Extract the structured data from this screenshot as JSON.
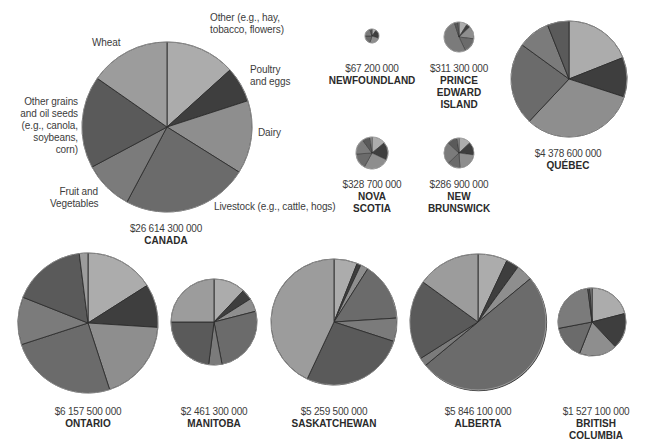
{
  "chart_data": [
    {
      "type": "pie",
      "title": "CANADA",
      "total_label": "$26 614 300 000",
      "categories": [
        "Other (e.g., hay, tobacco, flowers)",
        "Poultry and eggs",
        "Dairy",
        "Livestock (e.g., cattle, hogs)",
        "Fruit and Vegetables",
        "Other grains and oil seeds (e.g., canola, soybeans, corn)",
        "Wheat"
      ],
      "values": [
        13.3,
        6.7,
        13.9,
        23.9,
        9.4,
        17.5,
        15.3
      ],
      "unit": "percent (estimated from slice angles)",
      "legend_position": "labels around pie"
    },
    {
      "type": "pie",
      "title": "NEWFOUNDLAND",
      "total_label": "$67 200 000",
      "categories": [
        "Other",
        "Poultry and eggs",
        "Dairy",
        "Livestock",
        "Fruit and Vegetables",
        "Other grains and oil seeds",
        "Wheat"
      ],
      "values": [
        10,
        20,
        25,
        20,
        20,
        5,
        0
      ]
    },
    {
      "type": "pie",
      "title": "PRINCE EDWARD ISLAND",
      "total_label": "$311 300 000",
      "categories": [
        "Other",
        "Poultry and eggs",
        "Dairy",
        "Livestock",
        "Fruit and Vegetables",
        "Other grains and oil seeds",
        "Wheat"
      ],
      "values": [
        9,
        4,
        14,
        16,
        52,
        4,
        1
      ]
    },
    {
      "type": "pie",
      "title": "NOVA SCOTIA",
      "total_label": "$328 700 000",
      "categories": [
        "Other",
        "Poultry and eggs",
        "Dairy",
        "Livestock",
        "Fruit and Vegetables",
        "Other grains and oil seeds",
        "Wheat"
      ],
      "values": [
        14,
        18,
        26,
        16,
        16,
        8,
        2
      ]
    },
    {
      "type": "pie",
      "title": "NEW BRUNSWICK",
      "total_label": "$286 900 000",
      "categories": [
        "Other",
        "Poultry and eggs",
        "Dairy",
        "Livestock",
        "Fruit and Vegetables",
        "Other grains and oil seeds",
        "Wheat"
      ],
      "values": [
        13,
        14,
        22,
        14,
        24,
        11,
        2
      ]
    },
    {
      "type": "pie",
      "title": "QUÉBEC",
      "total_label": "$4 378 600 000",
      "categories": [
        "Other",
        "Poultry and eggs",
        "Dairy",
        "Livestock",
        "Fruit and Vegetables",
        "Other grains and oil seeds",
        "Wheat"
      ],
      "values": [
        19,
        11,
        32,
        23,
        9,
        6,
        0
      ]
    },
    {
      "type": "pie",
      "title": "ONTARIO",
      "total_label": "$6 157 500 000",
      "categories": [
        "Other",
        "Poultry and eggs",
        "Dairy",
        "Livestock",
        "Fruit and Vegetables",
        "Other grains and oil seeds",
        "Wheat"
      ],
      "values": [
        16,
        10,
        19,
        25,
        11,
        17,
        2
      ]
    },
    {
      "type": "pie",
      "title": "MANITOBA",
      "total_label": "$2 461 300 000",
      "categories": [
        "Other",
        "Poultry and eggs",
        "Dairy",
        "Livestock",
        "Fruit and Vegetables",
        "Other grains and oil seeds",
        "Wheat"
      ],
      "values": [
        12,
        4,
        5,
        26,
        5,
        23,
        25
      ]
    },
    {
      "type": "pie",
      "title": "SASKATCHEWAN",
      "total_label": "$5 259 500 000",
      "categories": [
        "Other",
        "Poultry and eggs",
        "Dairy",
        "Livestock",
        "Fruit and Vegetables",
        "Other grains and oil seeds",
        "Wheat"
      ],
      "values": [
        6,
        1,
        2,
        15,
        6,
        27,
        43
      ]
    },
    {
      "type": "pie",
      "title": "ALBERTA",
      "total_label": "$5 846 100 000",
      "categories": [
        "Other",
        "Poultry and eggs",
        "Dairy",
        "Livestock",
        "Fruit and Vegetables",
        "Other grains and oil seeds",
        "Wheat"
      ],
      "values": [
        7,
        3,
        4,
        50,
        2,
        19,
        15
      ]
    },
    {
      "type": "pie",
      "title": "BRITISH COLUMBIA",
      "total_label": "$1 527 100 000",
      "categories": [
        "Other",
        "Poultry and eggs",
        "Dairy",
        "Livestock",
        "Fruit and Vegetables",
        "Other grains and oil seeds",
        "Wheat"
      ],
      "values": [
        21,
        17,
        18,
        16,
        26,
        1,
        1
      ]
    }
  ],
  "colors": {
    "Other": "#acacac",
    "Poultry and eggs": "#3e3e3e",
    "Dairy": "#8e8e8e",
    "Livestock": "#6b6b6b",
    "Fruit and Vegetables": "#7b7b7b",
    "Other grains and oil seeds": "#5a5a5a",
    "Wheat": "#9c9c9c",
    "stroke": "#2e2e2e"
  },
  "canada_labels": {
    "other": "Other (e.g., hay,\ntobacco, flowers)",
    "poultry": "Poultry\nand eggs",
    "dairy": "Dairy",
    "livestock": "Livestock (e.g., cattle, hogs)",
    "fruit": "Fruit and\nVegetables",
    "grains": "Other grains\nand oil seeds\n(e.g., canola,\nsoybeans,\ncorn)",
    "wheat": "Wheat"
  },
  "provinces": {
    "canada": {
      "value": "$26 614 300 000",
      "name": "CANADA"
    },
    "newfoundland": {
      "value": "$67 200 000",
      "name": "NEWFOUNDLAND"
    },
    "pei": {
      "value": "$311 300 000",
      "name": "PRINCE\nEDWARD\nISLAND"
    },
    "novascotia": {
      "value": "$328 700 000",
      "name": "NOVA\nSCOTIA"
    },
    "newbrunswick": {
      "value": "$286 900 000",
      "name": "NEW\nBRUNSWICK"
    },
    "quebec": {
      "value": "$4 378 600 000",
      "name": "QUÉBEC"
    },
    "ontario": {
      "value": "$6 157 500 000",
      "name": "ONTARIO"
    },
    "manitoba": {
      "value": "$2 461 300 000",
      "name": "MANITOBA"
    },
    "saskatchewan": {
      "value": "$5 259 500 000",
      "name": "SASKATCHEWAN"
    },
    "alberta": {
      "value": "$5 846 100 000",
      "name": "ALBERTA"
    },
    "bc": {
      "value": "$1 527 100 000",
      "name": "BRITISH\nCOLUMBIA"
    }
  }
}
